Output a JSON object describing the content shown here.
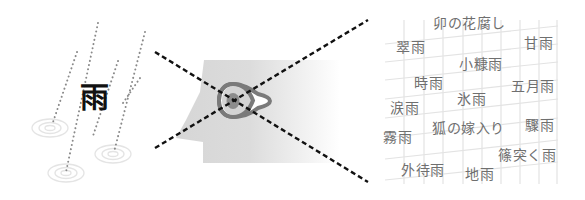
{
  "left_panel": {
    "title_char": "雨",
    "icon": "rain-streaks-with-ripples",
    "streaks": [
      {
        "x1": 77,
        "y1": 52,
        "x2": 52,
        "y2": 125
      },
      {
        "x1": 98,
        "y1": 23,
        "x2": 66,
        "y2": 172
      },
      {
        "x1": 118,
        "y1": 61,
        "x2": 93,
        "y2": 136
      },
      {
        "x1": 145,
        "y1": 32,
        "x2": 114,
        "y2": 152
      },
      {
        "x1": 140,
        "y1": 78,
        "x2": 121,
        "y2": 106
      }
    ],
    "ripples": [
      {
        "cx": 50,
        "cy": 128
      },
      {
        "cx": 66,
        "cy": 173
      },
      {
        "cx": 113,
        "cy": 154
      }
    ]
  },
  "center_panel": {
    "icon": "head-profile-with-eye",
    "crossed_out": true,
    "colors": {
      "head": "#d9d9d9",
      "eye_ring": "#7a7a7a",
      "pupil": "#8c8c8c",
      "dash": "#111111"
    }
  },
  "right_panel": {
    "words": [
      {
        "text": "卯の花腐し",
        "x": 433,
        "y": 16
      },
      {
        "text": "翠雨",
        "x": 396,
        "y": 40
      },
      {
        "text": "甘雨",
        "x": 524,
        "y": 36
      },
      {
        "text": "小糠雨",
        "x": 459,
        "y": 57
      },
      {
        "text": "時雨",
        "x": 414,
        "y": 76
      },
      {
        "text": "五月雨",
        "x": 511,
        "y": 79
      },
      {
        "text": "氷雨",
        "x": 457,
        "y": 92
      },
      {
        "text": "涙雨",
        "x": 390,
        "y": 101
      },
      {
        "text": "驟雨",
        "x": 525,
        "y": 118
      },
      {
        "text": "狐の嫁入り",
        "x": 432,
        "y": 121
      },
      {
        "text": "霧雨",
        "x": 383,
        "y": 130
      },
      {
        "text": "篠突く雨",
        "x": 498,
        "y": 148
      },
      {
        "text": "外待雨",
        "x": 401,
        "y": 163
      },
      {
        "text": "地雨",
        "x": 465,
        "y": 167
      }
    ]
  }
}
